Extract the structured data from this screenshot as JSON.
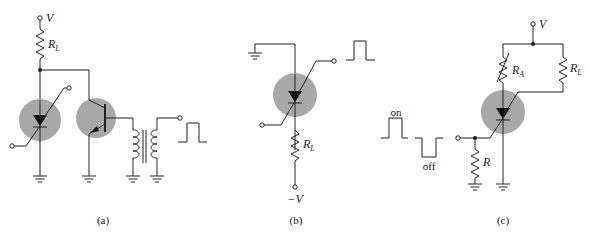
{
  "figure": {
    "panels": [
      {
        "id": "a",
        "caption": "(a)",
        "supply_label": "V",
        "resistor_label": "R",
        "resistor_sub": "L"
      },
      {
        "id": "b",
        "caption": "(b)",
        "supply_label": "−V",
        "resistor_label": "R",
        "resistor_sub": "L"
      },
      {
        "id": "c",
        "caption": "(c)",
        "supply_label": "V",
        "resistor_a_label": "R",
        "resistor_a_sub": "A",
        "resistor_l_label": "R",
        "resistor_l_sub": "L",
        "resistor_r_label": "R",
        "pulse_on_label": "on",
        "pulse_off_label": "off"
      }
    ],
    "colors": {
      "device_disc": "#a8a8a8",
      "wire": "#222222"
    }
  }
}
